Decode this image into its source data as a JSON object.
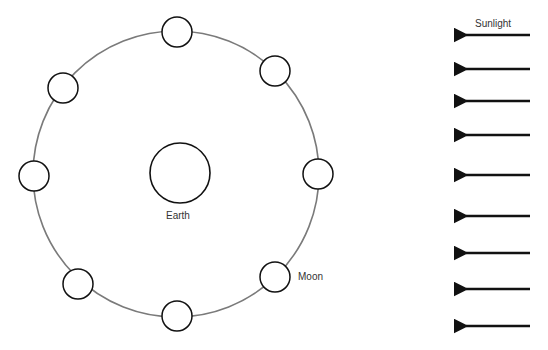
{
  "labels": {
    "earth": "Earth",
    "moon": "Moon",
    "sunlight": "Sunlight"
  },
  "orbit": {
    "cx": 176,
    "cy": 174,
    "r": 143,
    "color": "#7a7a7a"
  },
  "earth": {
    "cx": 180,
    "cy": 173,
    "r": 30
  },
  "moons": [
    {
      "cx": 177,
      "cy": 32
    },
    {
      "cx": 275,
      "cy": 71
    },
    {
      "cx": 318,
      "cy": 174
    },
    {
      "cx": 275,
      "cy": 277
    },
    {
      "cx": 177,
      "cy": 316
    },
    {
      "cx": 78,
      "cy": 284
    },
    {
      "cx": 34,
      "cy": 176
    },
    {
      "cx": 63,
      "cy": 88
    }
  ],
  "moon_radius": 15,
  "arrows": {
    "x1": 530,
    "x2": 460,
    "ys": [
      35,
      69,
      101,
      135,
      175,
      216,
      253,
      289,
      326
    ]
  }
}
